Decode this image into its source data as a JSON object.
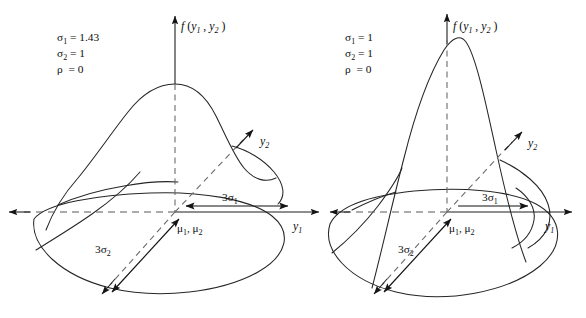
{
  "figure": {
    "background_color": "#ffffff",
    "line_color": "#1a1a1a",
    "dashed_color": "#585858",
    "width": 586,
    "height": 318
  },
  "panels": [
    {
      "id": "left-panel",
      "name": "elongated-surface",
      "params": {
        "sigma1": {
          "symbol": "σ",
          "subscript": "1",
          "equals": "=",
          "value": "1.43"
        },
        "sigma2": {
          "symbol": "σ",
          "subscript": "2",
          "equals": "=",
          "value": "1"
        },
        "rho": {
          "symbol": "ρ",
          "equals": "=",
          "value": "0"
        }
      },
      "labels": {
        "density": {
          "f": "f",
          "open": "(",
          "y1": "y",
          "sub1": "1",
          "comma": ",",
          "y2": "y",
          "sub2": "2",
          "close": ")"
        },
        "y1_axis": {
          "base": "y",
          "sub": "1"
        },
        "y2_axis": {
          "base": "y",
          "sub": "2"
        },
        "mu": {
          "m1": "μ",
          "s1": "1",
          "comma": ",",
          "m2": "μ",
          "s2": "2"
        },
        "three_sigma1": {
          "prefix": "3",
          "symbol": "σ",
          "sub": "1"
        },
        "three_sigma2": {
          "prefix": "3",
          "symbol": "σ",
          "sub": "2"
        }
      }
    },
    {
      "id": "right-panel",
      "name": "circular-surface",
      "params": {
        "sigma1": {
          "symbol": "σ",
          "subscript": "1",
          "equals": "=",
          "value": "1"
        },
        "sigma2": {
          "symbol": "σ",
          "subscript": "2",
          "equals": "=",
          "value": "1"
        },
        "rho": {
          "symbol": "ρ",
          "equals": "=",
          "value": "0"
        }
      },
      "labels": {
        "density": {
          "f": "f",
          "open": "(",
          "y1": "y",
          "sub1": "1",
          "comma": ",",
          "y2": "y",
          "sub2": "2",
          "close": ")"
        },
        "y1_axis": {
          "base": "y",
          "sub": "1"
        },
        "y2_axis": {
          "base": "y",
          "sub": "2"
        },
        "mu": {
          "m1": "μ",
          "s1": "1",
          "comma": ",",
          "m2": "μ",
          "s2": "2"
        },
        "three_sigma1": {
          "prefix": "3",
          "symbol": "σ",
          "sub": "1"
        },
        "three_sigma2": {
          "prefix": "3",
          "symbol": "σ",
          "sub": "2"
        }
      }
    }
  ]
}
